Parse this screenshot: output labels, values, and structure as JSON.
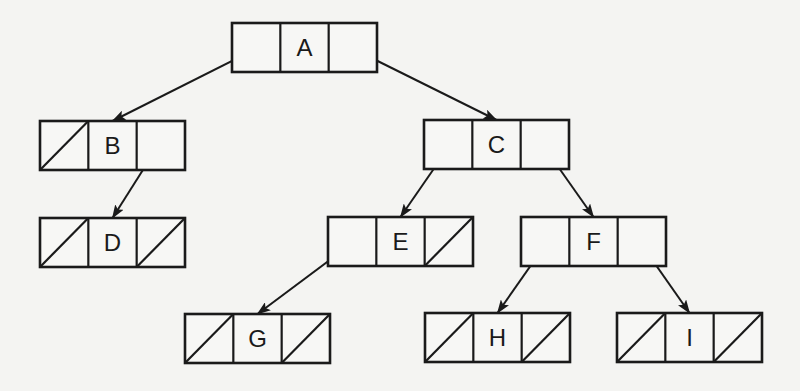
{
  "diagram": {
    "type": "binary-tree-linked-representation",
    "colors": {
      "background": "#f4f4f2",
      "stroke": "#1a1a1a"
    },
    "node_size": {
      "width": 145,
      "height": 49
    },
    "nodes": [
      {
        "id": "A",
        "label": "A",
        "x": 232,
        "y": 23,
        "left": "B",
        "right": "C"
      },
      {
        "id": "B",
        "label": "B",
        "x": 40,
        "y": 121,
        "left": null,
        "right": "D"
      },
      {
        "id": "C",
        "label": "C",
        "x": 424,
        "y": 120,
        "left": "E",
        "right": "F"
      },
      {
        "id": "D",
        "label": "D",
        "x": 40,
        "y": 218,
        "left": null,
        "right": null
      },
      {
        "id": "E",
        "label": "E",
        "x": 328,
        "y": 217,
        "left": "G",
        "right": null
      },
      {
        "id": "F",
        "label": "F",
        "x": 521,
        "y": 217,
        "left": "H",
        "right": "I"
      },
      {
        "id": "G",
        "label": "G",
        "x": 185,
        "y": 314,
        "left": null,
        "right": null
      },
      {
        "id": "H",
        "label": "H",
        "x": 425,
        "y": 313,
        "left": null,
        "right": null
      },
      {
        "id": "I",
        "label": "I",
        "x": 617,
        "y": 313,
        "left": null,
        "right": null
      }
    ],
    "edges": [
      {
        "from": "A",
        "side": "left",
        "to": "B"
      },
      {
        "from": "A",
        "side": "right",
        "to": "C"
      },
      {
        "from": "B",
        "side": "right",
        "to": "D"
      },
      {
        "from": "C",
        "side": "left",
        "to": "E"
      },
      {
        "from": "C",
        "side": "right",
        "to": "F"
      },
      {
        "from": "E",
        "side": "left",
        "to": "G"
      },
      {
        "from": "F",
        "side": "left",
        "to": "H"
      },
      {
        "from": "F",
        "side": "right",
        "to": "I"
      }
    ]
  }
}
